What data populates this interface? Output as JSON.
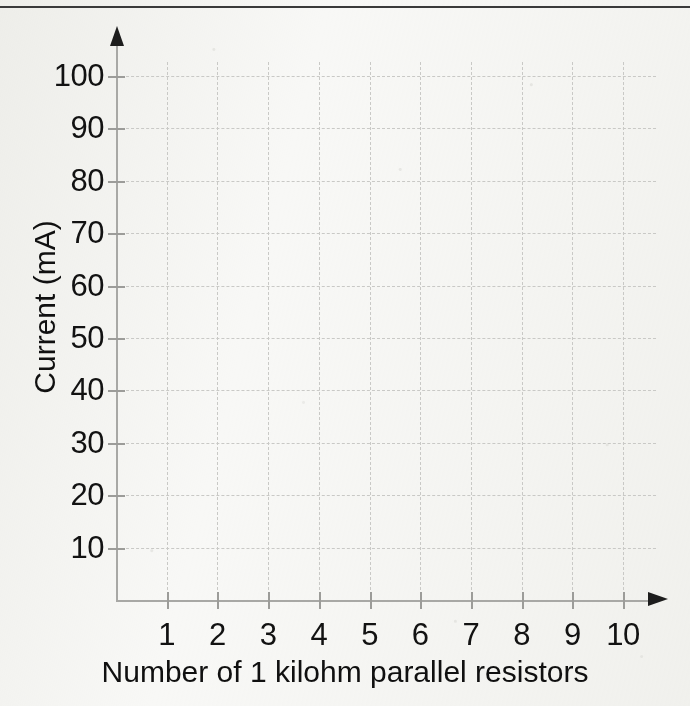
{
  "figure": {
    "background_color": "#f8f8f6",
    "ink_color": "#111111",
    "grid_color": "#c9c9c6",
    "axis_color": "#a8a8a5",
    "top_rule_color": "#3a3a3a"
  },
  "chart_data": {
    "type": "scatter",
    "title": "",
    "subtitle": "",
    "xlabel": "Number of 1 kilohm parallel resistors",
    "ylabel": "Current (mA)",
    "x_ticks": [
      1,
      2,
      3,
      4,
      5,
      6,
      7,
      8,
      9,
      10
    ],
    "x_tick_labels": [
      "1",
      "2",
      "3",
      "4",
      "5",
      "6",
      "7",
      "8",
      "9",
      "10"
    ],
    "y_ticks": [
      10,
      20,
      30,
      40,
      50,
      60,
      70,
      80,
      90,
      100
    ],
    "y_tick_labels": [
      "10",
      "20",
      "30",
      "40",
      "50",
      "60",
      "70",
      "80",
      "90",
      "100"
    ],
    "xlim": [
      0,
      10.5
    ],
    "ylim": [
      0,
      105
    ],
    "grid": true,
    "grid_style": "dashed",
    "legend": false,
    "legend_position": "none",
    "series": [],
    "values": [],
    "annotations": [],
    "note": "Blank answer grid - no data plotted; axes drawn as arrows"
  },
  "annotations": {
    "y_axis_arrow": "arrow-up-icon",
    "x_axis_arrow": "arrow-right-icon",
    "top_rule": "horizontal-rule"
  }
}
